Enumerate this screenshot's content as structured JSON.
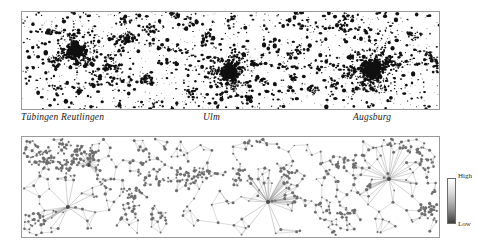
{
  "figure": {
    "name": "two-panel-settlement-and-network-figure",
    "background_color": "#ffffff",
    "width": 478,
    "height": 242
  },
  "top_panel": {
    "name": "settlement-density-map",
    "description": "Black dot-density map of built-up settlement areas",
    "border_color": "#9a9a9a",
    "dot_color": "#111111",
    "background_color": "#ffffff"
  },
  "city_labels": [
    {
      "label": "Tübingen Reutlingen"
    },
    {
      "label": "Ulm"
    },
    {
      "label": "Augsburg"
    }
  ],
  "bottom_panel": {
    "name": "network-graph-map",
    "description": "Spatial network graph with nodes and edges; hub nodes radiate star-like spokes",
    "border_color": "#9a9a9a",
    "node_color": "#6e6e6e",
    "edge_color": "#9b9b9b",
    "background_color": "#ffffff"
  },
  "legend": {
    "name": "density-colorbar",
    "high_label": "High",
    "low_label": "Low",
    "gradient_top_color": "#ffffff",
    "gradient_bottom_color": "#3f3f3f",
    "border_color": "#6b6b6b"
  },
  "chart_data": {
    "type": "scatter",
    "title": "",
    "xlabel": "",
    "ylabel": "",
    "panels": [
      {
        "name": "settlement-density-map",
        "type": "scatter",
        "encoding": "black polygons / dots = built-up settlement area",
        "annotations": [
          "Tübingen Reutlingen",
          "Ulm",
          "Augsburg"
        ],
        "clusters": [
          {
            "label": "Tübingen Reutlingen",
            "x_frac": 0.13,
            "y_frac": 0.4,
            "size": "large"
          },
          {
            "label": "Ulm",
            "x_frac": 0.5,
            "y_frac": 0.62,
            "size": "large"
          },
          {
            "label": "Augsburg",
            "x_frac": 0.84,
            "y_frac": 0.6,
            "size": "largest"
          }
        ]
      },
      {
        "name": "network-graph-map",
        "type": "scatter",
        "encoding": "gray nodes connected by gray edges; hubs radiate spokes",
        "hubs": [
          {
            "x_frac": 0.16,
            "y_frac": 0.28,
            "degree": "high"
          },
          {
            "x_frac": 0.11,
            "y_frac": 0.7,
            "degree": "medium"
          },
          {
            "x_frac": 0.59,
            "y_frac": 0.65,
            "degree": "highest"
          },
          {
            "x_frac": 0.88,
            "y_frac": 0.42,
            "degree": "high"
          }
        ],
        "legend": {
          "position": "right",
          "high": "High",
          "low": "Low"
        }
      }
    ]
  }
}
